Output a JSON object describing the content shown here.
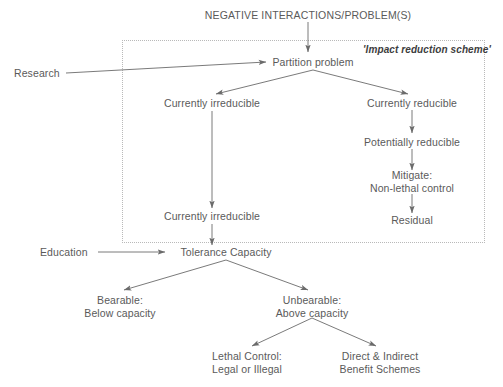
{
  "diagram": {
    "title": "NEGATIVE INTERACTIONS/PROBLEM(S)",
    "scheme_label": "'Impact reduction scheme'",
    "colors": {
      "text": "#5a5a5a",
      "line": "#6b6b6b",
      "dotted_box": "#b9b9b9",
      "background": "#ffffff"
    },
    "nodes": [
      {
        "id": "research",
        "label": "Research",
        "x": 14,
        "y": 73,
        "align": "left"
      },
      {
        "id": "partition-problem",
        "label": "Partition problem",
        "x": 313,
        "y": 62,
        "align": "center"
      },
      {
        "id": "currently-irreducible-1",
        "label": "Currently irreducible",
        "x": 212,
        "y": 103,
        "align": "center"
      },
      {
        "id": "currently-reducible",
        "label": "Currently reducible",
        "x": 412,
        "y": 103,
        "align": "center"
      },
      {
        "id": "potentially-reducible",
        "label": "Potentially reducible",
        "x": 412,
        "y": 142,
        "align": "center"
      },
      {
        "id": "mitigate",
        "label": "Mitigate:\nNon-lethal control",
        "x": 412,
        "y": 181,
        "align": "center"
      },
      {
        "id": "residual",
        "label": "Residual",
        "x": 412,
        "y": 220,
        "align": "center"
      },
      {
        "id": "currently-irreducible-2",
        "label": "Currently irreducible",
        "x": 212,
        "y": 216,
        "align": "center"
      },
      {
        "id": "education",
        "label": "Education",
        "x": 40,
        "y": 252,
        "align": "left"
      },
      {
        "id": "tolerance-capacity",
        "label": "Tolerance Capacity",
        "x": 226,
        "y": 252,
        "align": "center"
      },
      {
        "id": "bearable",
        "label": "Bearable:\nBelow capacity",
        "x": 120,
        "y": 306,
        "align": "center"
      },
      {
        "id": "unbearable",
        "label": "Unbearable:\nAbove capacity",
        "x": 312,
        "y": 306,
        "align": "center"
      },
      {
        "id": "lethal-control",
        "label": "Lethal Control:\nLegal or Illegal",
        "x": 247,
        "y": 362,
        "align": "center"
      },
      {
        "id": "benefit-schemes",
        "label": "Direct & Indirect\nBenefit Schemes",
        "x": 380,
        "y": 362,
        "align": "center"
      }
    ],
    "dotted_box": {
      "x": 122,
      "y": 40,
      "width": 363,
      "height": 203
    },
    "edges": [
      {
        "from": "title",
        "to": "partition-problem",
        "type": "arrow-down"
      },
      {
        "from": "research",
        "to": "partition-problem",
        "type": "arrow-right"
      },
      {
        "from": "partition-problem",
        "to": "currently-irreducible-1",
        "type": "arrow-branch-left"
      },
      {
        "from": "partition-problem",
        "to": "currently-reducible",
        "type": "arrow-branch-right"
      },
      {
        "from": "currently-reducible",
        "to": "potentially-reducible",
        "type": "arrow-down"
      },
      {
        "from": "potentially-reducible",
        "to": "mitigate",
        "type": "arrow-down"
      },
      {
        "from": "mitigate",
        "to": "residual",
        "type": "arrow-down"
      },
      {
        "from": "currently-irreducible-1",
        "to": "currently-irreducible-2",
        "type": "arrow-down"
      },
      {
        "from": "currently-irreducible-2",
        "to": "tolerance-capacity",
        "type": "arrow-down"
      },
      {
        "from": "education",
        "to": "tolerance-capacity",
        "type": "arrow-right"
      },
      {
        "from": "tolerance-capacity",
        "to": "bearable",
        "type": "arrow-branch-left"
      },
      {
        "from": "tolerance-capacity",
        "to": "unbearable",
        "type": "arrow-branch-right"
      },
      {
        "from": "unbearable",
        "to": "lethal-control",
        "type": "arrow-branch-left"
      },
      {
        "from": "unbearable",
        "to": "benefit-schemes",
        "type": "arrow-branch-right"
      }
    ]
  }
}
